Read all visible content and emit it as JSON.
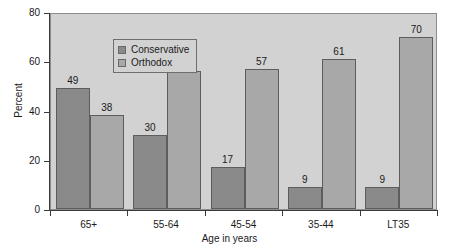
{
  "chart_data": {
    "type": "bar",
    "title": "",
    "subtitle": "",
    "xlabel": "Age in years",
    "ylabel": "Percent",
    "categories": [
      "65+",
      "55-64",
      "45-54",
      "35-44",
      "LT35"
    ],
    "series": [
      {
        "name": "Conservative",
        "color": "#8a8a8a",
        "values": [
          49,
          30,
          17,
          9,
          9
        ]
      },
      {
        "name": "Orthodox",
        "color": "#a8a8a8",
        "values": [
          38,
          56,
          57,
          61,
          70
        ]
      }
    ],
    "ylim": [
      0,
      80
    ],
    "yticks": [
      0,
      20,
      40,
      60,
      80
    ],
    "ytick_labels": [
      "0",
      "20",
      "40",
      "60",
      "80"
    ],
    "grid": false,
    "legend_position": "upper-left-inside",
    "value_labels": true,
    "plot_background": "#d2d2d2",
    "figure_background": "#ffffff",
    "axis_color": "#3a3a3a",
    "bar_edge_color": "#5d5d5d"
  },
  "legend": {
    "entries": [
      {
        "label": "Conservative"
      },
      {
        "label": "Orthodox"
      }
    ]
  }
}
